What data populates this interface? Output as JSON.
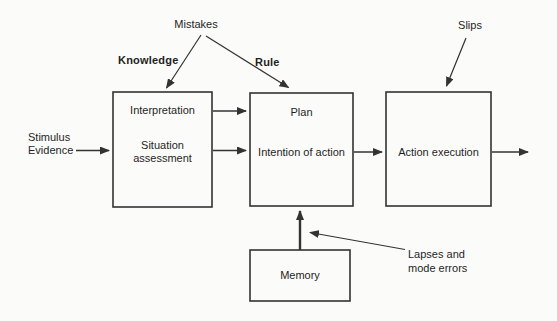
{
  "diagram": {
    "error_labels": {
      "mistakes": "Mistakes",
      "knowledge": "Knowledge",
      "rule": "Rule",
      "slips": "Slips",
      "lapses_line1": "Lapses and",
      "lapses_line2": "mode errors"
    },
    "input": {
      "line1": "Stimulus",
      "line2": "Evidence"
    },
    "boxes": {
      "situation_assessment": {
        "top_label": "Interpretation",
        "bottom_line1": "Situation",
        "bottom_line2": "assessment"
      },
      "planning": {
        "top_label": "Plan",
        "bottom_label": "Intention of action"
      },
      "execution": {
        "label": "Action execution"
      },
      "memory": {
        "label": "Memory"
      }
    },
    "colors": {
      "line": "#333333",
      "text": "#1f1f1f",
      "background": "#fbfbf9"
    }
  }
}
